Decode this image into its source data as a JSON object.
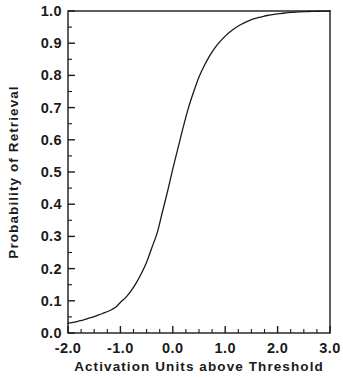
{
  "chart_data": {
    "type": "line",
    "title": "",
    "xlabel": "Activation Units above Threshold",
    "ylabel": "Probability of Retrieval",
    "xlim": [
      -2.0,
      3.0
    ],
    "ylim": [
      0.0,
      1.0
    ],
    "grid": false,
    "legend": "none",
    "line_color": "#1a1a1a",
    "x_ticks": [
      "-2.0",
      "-1.0",
      "0.0",
      "1.0",
      "2.0",
      "3.0"
    ],
    "x_tick_values": [
      -2.0,
      -1.0,
      0.0,
      1.0,
      2.0,
      3.0
    ],
    "x_minor_step": 0.25,
    "y_ticks": [
      "0.0",
      "0.1",
      "0.2",
      "0.3",
      "0.4",
      "0.5",
      "0.6",
      "0.7",
      "0.8",
      "0.9",
      "1.0"
    ],
    "y_tick_values": [
      0.0,
      0.1,
      0.2,
      0.3,
      0.4,
      0.5,
      0.6,
      0.7,
      0.8,
      0.9,
      1.0
    ],
    "y_minor_step": 0.05,
    "series": [
      {
        "name": "Probability of Retrieval",
        "x": [
          -2.0,
          -1.9,
          -1.8,
          -1.7,
          -1.6,
          -1.5,
          -1.4,
          -1.3,
          -1.2,
          -1.1,
          -1.0,
          -0.9,
          -0.8,
          -0.7,
          -0.6,
          -0.5,
          -0.4,
          -0.3,
          -0.2,
          -0.1,
          0.0,
          0.1,
          0.2,
          0.3,
          0.4,
          0.5,
          0.6,
          0.7,
          0.8,
          0.9,
          1.0,
          1.1,
          1.2,
          1.3,
          1.4,
          1.5,
          1.6,
          1.7,
          1.8,
          1.9,
          2.0,
          2.1,
          2.2,
          2.3,
          2.4,
          2.5,
          2.6,
          2.7,
          2.8,
          2.9,
          3.0
        ],
        "values": [
          0.03,
          0.033,
          0.037,
          0.041,
          0.046,
          0.051,
          0.057,
          0.063,
          0.07,
          0.079,
          0.095,
          0.11,
          0.13,
          0.155,
          0.185,
          0.22,
          0.265,
          0.31,
          0.375,
          0.44,
          0.51,
          0.575,
          0.64,
          0.7,
          0.75,
          0.795,
          0.83,
          0.86,
          0.885,
          0.905,
          0.922,
          0.936,
          0.948,
          0.958,
          0.966,
          0.973,
          0.978,
          0.982,
          0.986,
          0.989,
          0.991,
          0.993,
          0.995,
          0.996,
          0.997,
          0.998,
          0.9985,
          0.999,
          0.9993,
          0.9996,
          1.0
        ]
      }
    ]
  }
}
